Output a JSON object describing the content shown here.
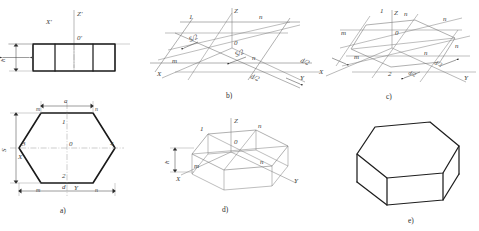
{
  "drawing": {
    "title": "Isometric construction of a regular hexagonal prism",
    "panels": [
      {
        "id": "a",
        "caption": "a)",
        "description": "orthographic front view and hexagonal top view"
      },
      {
        "id": "b",
        "caption": "b)",
        "description": "isometric axes with half-diagonal setting out"
      },
      {
        "id": "c",
        "caption": "c)",
        "description": "hexagon vertices located on the isometric plane"
      },
      {
        "id": "d",
        "caption": "d)",
        "description": "prism height h projected downward"
      },
      {
        "id": "e",
        "caption": "e)",
        "description": "completed hexagonal prism"
      }
    ],
    "panel_a": {
      "front_view": {
        "axis_z": "Z'",
        "axis_x": "X'",
        "origin": "0'",
        "height_dim": "h",
        "width_dim": "a",
        "left_face": "m",
        "right_face": "n"
      },
      "top_view": {
        "vertices": [
          "1",
          "2",
          "3",
          "4"
        ],
        "origin": "0",
        "corner_labels": [
          "m",
          "n",
          "m",
          "n"
        ],
        "axis_x": "X",
        "axis_y": "Y",
        "across_flats": "S",
        "across_corners": "d",
        "side": "a"
      }
    },
    "panel_b": {
      "axis_x": "X",
      "axis_y": "Y",
      "axis_z": "Z",
      "origin": "0",
      "points": [
        "1",
        "n",
        "m",
        "n"
      ],
      "dims": [
        "S/2",
        "S/2",
        "d/2",
        "d/2"
      ]
    },
    "panel_c": {
      "axis_x": "X",
      "axis_y": "Y",
      "axis_z": "Z",
      "origin": "0",
      "points": [
        "1",
        "n",
        "m",
        "m",
        "n",
        "n",
        "n",
        "2"
      ],
      "dims": [
        "d/2",
        "d/2"
      ]
    },
    "panel_d": {
      "axis_x": "X",
      "axis_y": "Y",
      "axis_z": "Z",
      "origin": "0",
      "points": [
        "1",
        "n",
        "m",
        "n"
      ],
      "height_dim": "h"
    },
    "panel_e": {
      "description": "finished solid"
    },
    "colors": {
      "outline": "#1e1e1e",
      "construction": "#6e6e6e",
      "axis": "#8a8a8a",
      "dimension": "#4a4a4a",
      "background": "#ffffff"
    }
  }
}
